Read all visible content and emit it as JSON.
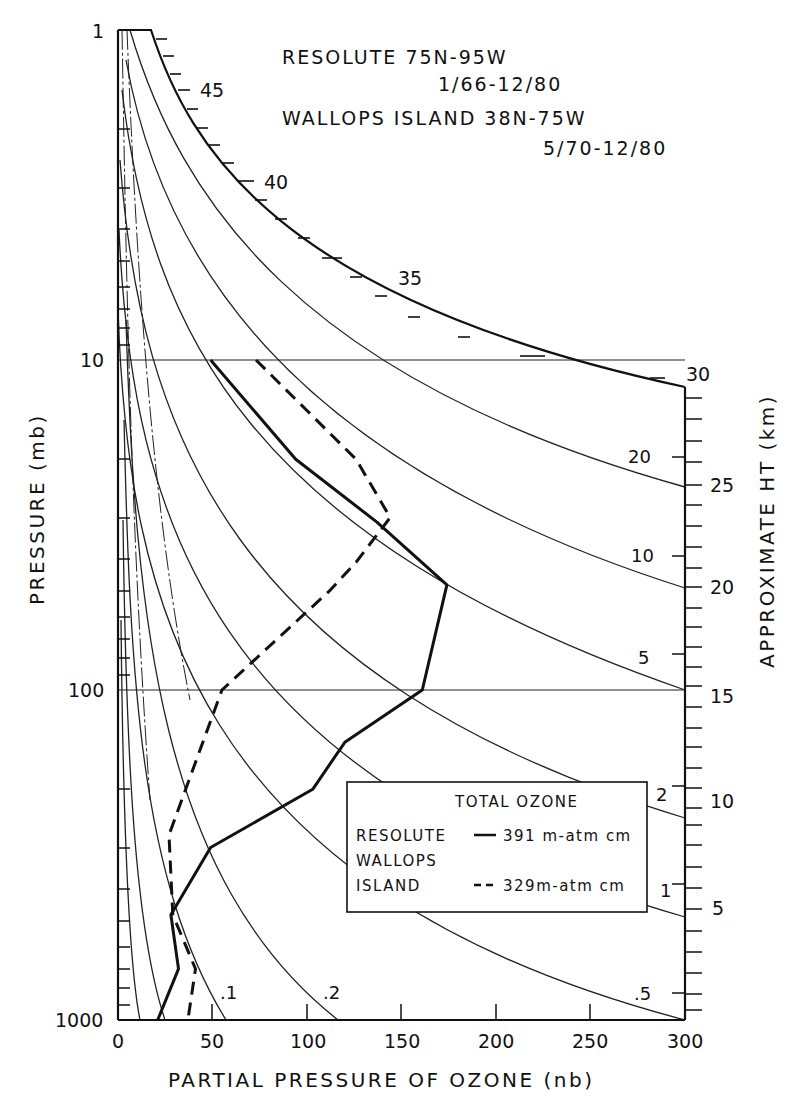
{
  "chart_data": {
    "type": "line",
    "title": [
      "RESOLUTE 75N-95W",
      "1/66-12/80",
      "WALLOPS ISLAND 38N-75W",
      "5/70-12/80"
    ],
    "xlabel": "PARTIAL PRESSURE OF OZONE (nb)",
    "ylabel": "PRESSURE (mb)",
    "y2label": "APPROXIMATE HT (km)",
    "xlim": [
      0,
      300
    ],
    "ylim": [
      1000,
      1
    ],
    "yscale": "log",
    "x_ticks": [
      0,
      50,
      100,
      150,
      200,
      250,
      300
    ],
    "y_ticks": [
      1,
      10,
      100,
      1000
    ],
    "height_ticks_km": [
      5,
      10,
      15,
      20,
      25,
      30,
      35,
      40,
      45
    ],
    "grid": "horizontal lines at 10 and 100 mb",
    "series": [
      {
        "name": "RESOLUTE",
        "style": "solid",
        "total_ozone": "391 m-atm cm",
        "points": [
          {
            "x": 49,
            "p": 10
          },
          {
            "x": 94,
            "p": 20
          },
          {
            "x": 137,
            "p": 31
          },
          {
            "x": 174,
            "p": 48
          },
          {
            "x": 161,
            "p": 100
          },
          {
            "x": 120,
            "p": 144
          },
          {
            "x": 103,
            "p": 200
          },
          {
            "x": 49,
            "p": 300
          },
          {
            "x": 28,
            "p": 480
          },
          {
            "x": 32,
            "p": 700
          },
          {
            "x": 21,
            "p": 1000
          }
        ]
      },
      {
        "name": "WALLOPS ISLAND",
        "style": "dashed",
        "total_ozone": "329 m-atm cm",
        "points": [
          {
            "x": 73,
            "p": 10
          },
          {
            "x": 126,
            "p": 20
          },
          {
            "x": 144,
            "p": 30
          },
          {
            "x": 126,
            "p": 41
          },
          {
            "x": 112,
            "p": 50
          },
          {
            "x": 55,
            "p": 100
          },
          {
            "x": 27,
            "p": 275
          },
          {
            "x": 29,
            "p": 480
          },
          {
            "x": 41,
            "p": 700
          },
          {
            "x": 37,
            "p": 1000
          }
        ]
      }
    ],
    "mixing_ratio_isolines": [
      ".1",
      ".2",
      ".5",
      "1",
      "2",
      "5",
      "10",
      "20"
    ],
    "legend": {
      "title": "TOTAL OZONE",
      "entries": [
        {
          "label": "RESOLUTE",
          "line": "solid",
          "value": "391 m-atm cm"
        },
        {
          "label": "WALLOPS ISLAND",
          "line": "dashed",
          "value": "329 m-atm cm"
        }
      ]
    }
  },
  "labels": {
    "title_line1": "RESOLUTE 75N-95W",
    "title_line2": "1/66-12/80",
    "title_line3": "WALLOPS ISLAND 38N-75W",
    "title_line4": "5/70-12/80",
    "xlabel": "PARTIAL PRESSURE OF OZONE (nb)",
    "ylabel": "PRESSURE (mb)",
    "y2label": "APPROXIMATE HT (km)",
    "x_ticks": [
      "0",
      "50",
      "100",
      "150",
      "200",
      "250",
      "300"
    ],
    "y_ticks": [
      "1",
      "10",
      "100",
      "1000"
    ],
    "km_ticks": [
      "45",
      "40",
      "35",
      "30",
      "25",
      "20",
      "15",
      "10",
      "5"
    ],
    "iso_labels": [
      "20",
      "10",
      "5",
      "2",
      "1",
      ".5",
      ".2",
      ".1"
    ],
    "legend_title": "TOTAL OZONE",
    "legend_resolute": "RESOLUTE",
    "legend_resolute_value": "391 m-atm cm",
    "legend_wallops_1": "WALLOPS",
    "legend_wallops_2": "ISLAND",
    "legend_wallops_value": "329m-atm cm"
  }
}
